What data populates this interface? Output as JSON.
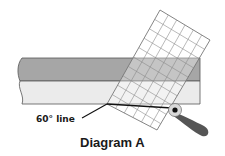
{
  "diagram": {
    "caption": "Diagram A",
    "callout_label": "60° line",
    "colors": {
      "fabric_dark": "#a6a6a6",
      "fabric_light": "#ebebeb",
      "outline": "#555555",
      "ruler_grid": "#8c8c8c",
      "cut_line": "#111111",
      "cutter_handle": "#555555",
      "cutter_blade": "#d9d9d9"
    },
    "elements": [
      {
        "name": "fabric-strip",
        "description": "Horizontal fabric strip, dark upper band and light lower band"
      },
      {
        "name": "grid-ruler",
        "description": "Transparent gridded ruler rotated to 60 degrees"
      },
      {
        "name": "cut-line",
        "description": "60° line along ruler bottom edge"
      },
      {
        "name": "rotary-cutter",
        "description": "Rotary cutter at right end of cut line"
      }
    ]
  }
}
